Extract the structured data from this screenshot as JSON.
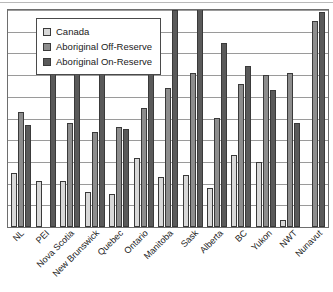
{
  "chart_data": {
    "type": "bar",
    "title": "",
    "xlabel": "",
    "ylabel": "",
    "ylim": [
      0,
      10
    ],
    "grid": true,
    "legend_position": "top-left",
    "categories": [
      "NL",
      "PEI",
      "Nova Scotia",
      "New Brunswick",
      "Quebec",
      "Ontario",
      "Manitoba",
      "Sask",
      "Alberta",
      "BC",
      "Yukon",
      "NWT",
      "Nunavut"
    ],
    "series": [
      {
        "name": "Canada",
        "color": "#d8d8d8",
        "values": [
          2.5,
          2.1,
          2.1,
          1.6,
          1.5,
          3.2,
          2.3,
          2.4,
          1.8,
          3.3,
          3.0,
          0.3,
          0.0
        ]
      },
      {
        "name": "Aboriginal Off-Reserve",
        "color": "#8d8d8d",
        "values": [
          5.3,
          0.0,
          4.8,
          4.4,
          4.6,
          5.5,
          6.4,
          7.1,
          5.0,
          6.6,
          7.0,
          7.1,
          9.5
        ]
      },
      {
        "name": "Aboriginal On-Reserve",
        "color": "#5a5a5a",
        "values": [
          4.7,
          9.2,
          8.2,
          8.7,
          4.5,
          9.1,
          10.0,
          10.3,
          8.5,
          7.4,
          6.3,
          4.8,
          9.9
        ]
      }
    ]
  },
  "legend": {
    "items": [
      {
        "label": "Canada",
        "swatch": "canada"
      },
      {
        "label": "Aboriginal Off-Reserve",
        "swatch": "off"
      },
      {
        "label": "Aboriginal On-Reserve",
        "swatch": "on"
      }
    ]
  },
  "axis": {
    "gridline_count": 10
  }
}
